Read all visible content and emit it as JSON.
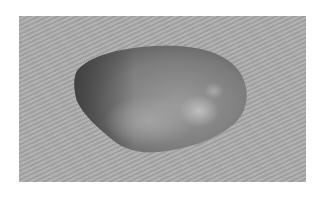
{
  "image": {
    "subject": "smooth stone on grey background",
    "colors": {
      "page_background": "#ffffff",
      "photo_background": "#a9a9a9",
      "stone_dark": "#4a4a4a",
      "stone_mid": "#7a7a7a",
      "stone_light": "#b5b5b5"
    }
  }
}
